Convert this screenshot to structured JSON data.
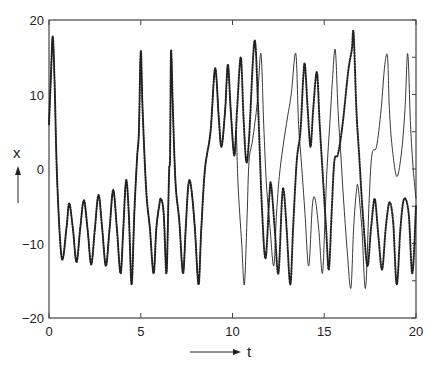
{
  "chart_data": {
    "type": "line",
    "title": "",
    "xlabel": "t",
    "ylabel": "x",
    "xlim": [
      0,
      20
    ],
    "ylim": [
      -20,
      20
    ],
    "x_ticks": [
      0,
      5,
      10,
      15,
      20
    ],
    "x_tick_labels": [
      "0",
      "5",
      "10",
      "15",
      "20"
    ],
    "y_ticks": [
      -20,
      -10,
      0,
      10,
      20
    ],
    "y_tick_labels": [
      "-20",
      "-10",
      "0",
      "10",
      "20"
    ],
    "y_minor_ticks": [
      -15,
      -5,
      5,
      15
    ],
    "grid": false,
    "legend": null,
    "series": [
      {
        "name": "trajectory A (dotted)",
        "style": "dotted",
        "points": [
          [
            0.0,
            6
          ],
          [
            0.1,
            12
          ],
          [
            0.2,
            17.8
          ],
          [
            0.3,
            12
          ],
          [
            0.45,
            -2
          ],
          [
            0.7,
            -12
          ],
          [
            0.95,
            -8
          ],
          [
            1.1,
            -4.6
          ],
          [
            1.3,
            -8
          ],
          [
            1.5,
            -12.5
          ],
          [
            1.7,
            -8
          ],
          [
            1.9,
            -4.2
          ],
          [
            2.1,
            -8
          ],
          [
            2.3,
            -12.8
          ],
          [
            2.5,
            -8
          ],
          [
            2.7,
            -3.5
          ],
          [
            2.9,
            -8
          ],
          [
            3.1,
            -13
          ],
          [
            3.3,
            -8
          ],
          [
            3.5,
            -2.8
          ],
          [
            3.7,
            -8
          ],
          [
            3.9,
            -14
          ],
          [
            4.05,
            -8
          ],
          [
            4.2,
            -1.5
          ],
          [
            4.35,
            -6
          ],
          [
            4.5,
            -15.5
          ],
          [
            4.65,
            -6
          ],
          [
            4.8,
            1.5
          ],
          [
            4.9,
            5
          ],
          [
            5.0,
            15.8
          ],
          [
            5.1,
            8
          ],
          [
            5.3,
            -3
          ],
          [
            5.5,
            -8
          ],
          [
            5.7,
            -14
          ],
          [
            5.85,
            -8
          ],
          [
            6.0,
            -5
          ],
          [
            6.1,
            -4
          ],
          [
            6.25,
            -6
          ],
          [
            6.4,
            -14
          ],
          [
            6.5,
            -5
          ],
          [
            6.55,
            0
          ],
          [
            6.6,
            2
          ],
          [
            6.65,
            15.8
          ],
          [
            6.75,
            8
          ],
          [
            6.9,
            -2
          ],
          [
            7.1,
            -7
          ],
          [
            7.3,
            -14
          ],
          [
            7.45,
            -8
          ],
          [
            7.6,
            -2
          ],
          [
            7.75,
            -2.5
          ],
          [
            7.95,
            -8
          ],
          [
            8.15,
            -15.5
          ],
          [
            8.3,
            -8
          ],
          [
            8.5,
            0
          ],
          [
            8.8,
            5
          ],
          [
            9.05,
            13.5
          ],
          [
            9.25,
            7
          ],
          [
            9.4,
            3
          ],
          [
            9.6,
            8
          ],
          [
            9.75,
            14
          ],
          [
            9.9,
            8
          ],
          [
            10.1,
            1.8
          ],
          [
            10.25,
            8
          ],
          [
            10.45,
            15
          ],
          [
            10.6,
            7
          ],
          [
            10.75,
            1
          ],
          [
            10.9,
            4
          ],
          [
            11.2,
            17.2
          ],
          [
            11.4,
            8
          ],
          [
            11.6,
            -5
          ],
          [
            11.8,
            -12
          ],
          [
            12.0,
            -4
          ],
          [
            12.1,
            -2
          ],
          [
            12.3,
            -8
          ],
          [
            12.5,
            -14
          ],
          [
            12.7,
            -4
          ],
          [
            12.8,
            -3
          ],
          [
            12.95,
            -8
          ],
          [
            13.15,
            -15.5
          ],
          [
            13.3,
            -8
          ],
          [
            13.5,
            1
          ],
          [
            13.7,
            5
          ],
          [
            13.85,
            12
          ],
          [
            13.95,
            14
          ],
          [
            14.1,
            8
          ],
          [
            14.25,
            3
          ],
          [
            14.4,
            8
          ],
          [
            14.6,
            13
          ],
          [
            14.75,
            6
          ],
          [
            14.9,
            0
          ],
          [
            15.1,
            -8
          ],
          [
            15.25,
            -13.5
          ],
          [
            15.4,
            -6
          ],
          [
            15.55,
            1
          ],
          [
            15.75,
            2
          ],
          [
            16.0,
            6
          ],
          [
            16.3,
            13
          ],
          [
            16.5,
            16
          ],
          [
            16.6,
            18.2
          ],
          [
            16.75,
            8
          ],
          [
            16.9,
            2
          ],
          [
            17.1,
            -6
          ],
          [
            17.35,
            -13
          ],
          [
            17.55,
            -8
          ],
          [
            17.75,
            -4
          ],
          [
            17.95,
            -9
          ],
          [
            18.15,
            -13.5
          ],
          [
            18.35,
            -8
          ],
          [
            18.55,
            -4.5
          ],
          [
            18.75,
            -7
          ],
          [
            18.95,
            -15.5
          ],
          [
            19.15,
            -8
          ],
          [
            19.35,
            -4
          ],
          [
            19.6,
            -6
          ],
          [
            19.8,
            -14
          ],
          [
            20.0,
            -5
          ]
        ]
      },
      {
        "name": "trajectory B (solid)",
        "style": "solid",
        "points": [
          [
            0.0,
            6
          ],
          [
            0.1,
            12
          ],
          [
            0.2,
            17.8
          ],
          [
            0.3,
            12
          ],
          [
            0.45,
            -2
          ],
          [
            0.7,
            -12
          ],
          [
            0.95,
            -8
          ],
          [
            1.1,
            -4.6
          ],
          [
            1.3,
            -8
          ],
          [
            1.5,
            -12.5
          ],
          [
            1.7,
            -8
          ],
          [
            1.9,
            -4.2
          ],
          [
            2.1,
            -8
          ],
          [
            2.3,
            -12.8
          ],
          [
            2.5,
            -8
          ],
          [
            2.7,
            -3.5
          ],
          [
            2.9,
            -8
          ],
          [
            3.1,
            -13
          ],
          [
            3.3,
            -8
          ],
          [
            3.5,
            -2.8
          ],
          [
            3.7,
            -8
          ],
          [
            3.9,
            -14
          ],
          [
            4.05,
            -8
          ],
          [
            4.2,
            -1.5
          ],
          [
            4.35,
            -6
          ],
          [
            4.5,
            -15.5
          ],
          [
            4.65,
            -6
          ],
          [
            4.8,
            1.5
          ],
          [
            4.9,
            5
          ],
          [
            5.0,
            15.8
          ],
          [
            5.1,
            8
          ],
          [
            5.3,
            -3
          ],
          [
            5.5,
            -8
          ],
          [
            5.7,
            -14
          ],
          [
            5.85,
            -8
          ],
          [
            6.0,
            -5
          ],
          [
            6.1,
            -4
          ],
          [
            6.25,
            -6
          ],
          [
            6.4,
            -14
          ],
          [
            6.5,
            -5
          ],
          [
            6.55,
            0
          ],
          [
            6.6,
            2
          ],
          [
            6.65,
            15.8
          ],
          [
            6.75,
            8
          ],
          [
            6.9,
            -2
          ],
          [
            7.1,
            -7
          ],
          [
            7.3,
            -14
          ],
          [
            7.45,
            -8
          ],
          [
            7.6,
            -2
          ],
          [
            7.75,
            -2.5
          ],
          [
            7.95,
            -8
          ],
          [
            8.15,
            -15.5
          ],
          [
            8.3,
            -8
          ],
          [
            8.5,
            0
          ],
          [
            8.8,
            5
          ],
          [
            9.05,
            13.5
          ],
          [
            9.25,
            7
          ],
          [
            9.4,
            3
          ],
          [
            9.6,
            8
          ],
          [
            9.75,
            14
          ],
          [
            9.9,
            8
          ],
          [
            10.1,
            1.8
          ],
          [
            10.2,
            5
          ],
          [
            10.3,
            -2
          ],
          [
            10.5,
            -10
          ],
          [
            10.65,
            -15.5
          ],
          [
            10.8,
            -6
          ],
          [
            10.9,
            1
          ],
          [
            11.1,
            4
          ],
          [
            11.35,
            9
          ],
          [
            11.55,
            15.5
          ],
          [
            11.7,
            6
          ],
          [
            11.85,
            -2
          ],
          [
            12.05,
            -8
          ],
          [
            12.25,
            -13
          ],
          [
            12.4,
            -6
          ],
          [
            12.55,
            -1
          ],
          [
            12.75,
            3
          ],
          [
            13.0,
            7
          ],
          [
            13.2,
            10
          ],
          [
            13.45,
            15.5
          ],
          [
            13.6,
            6
          ],
          [
            13.75,
            1
          ],
          [
            13.95,
            -6
          ],
          [
            14.15,
            -13
          ],
          [
            14.35,
            -5
          ],
          [
            14.5,
            -4
          ],
          [
            14.7,
            -8
          ],
          [
            14.9,
            -14
          ],
          [
            15.05,
            -6
          ],
          [
            15.15,
            0
          ],
          [
            15.3,
            6
          ],
          [
            15.45,
            12
          ],
          [
            15.6,
            16
          ],
          [
            15.75,
            8
          ],
          [
            15.9,
            2
          ],
          [
            16.05,
            -4
          ],
          [
            16.25,
            -11
          ],
          [
            16.45,
            -16
          ],
          [
            16.6,
            -8
          ],
          [
            16.75,
            -3
          ],
          [
            16.85,
            -2.5
          ],
          [
            17.05,
            -8
          ],
          [
            17.25,
            -16
          ],
          [
            17.45,
            -4
          ],
          [
            17.6,
            2
          ],
          [
            17.85,
            3
          ],
          [
            18.1,
            8
          ],
          [
            18.3,
            14
          ],
          [
            18.45,
            15
          ],
          [
            18.55,
            8
          ],
          [
            18.7,
            3
          ],
          [
            18.95,
            -1
          ],
          [
            19.2,
            2
          ],
          [
            19.4,
            8
          ],
          [
            19.55,
            15.5
          ],
          [
            19.7,
            6
          ],
          [
            19.85,
            0
          ],
          [
            20.0,
            -4
          ]
        ]
      }
    ]
  },
  "figure": {
    "xlabel": "t",
    "ylabel": "x",
    "x_tick_labels": [
      "0",
      "5",
      "10",
      "15",
      "20"
    ],
    "y_tick_labels": [
      "-20",
      "-10",
      "0",
      "10",
      "20"
    ]
  }
}
